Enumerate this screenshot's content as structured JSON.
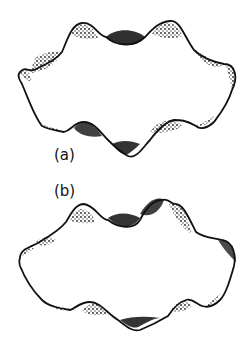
{
  "figure": {
    "panels": [
      {
        "id": "a",
        "label": "(a)",
        "description": "Wavy closed outline with shaded lobes (mode shape a)"
      },
      {
        "id": "b",
        "label": "(b)",
        "description": "Wavy closed outline with shaded lobes (mode shape b)"
      }
    ],
    "colors": {
      "stroke": "#111111",
      "shade": "#2a2a2a",
      "background": "#ffffff"
    }
  }
}
